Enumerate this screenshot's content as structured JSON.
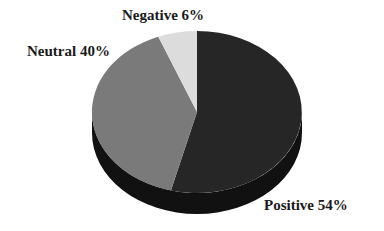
{
  "chart_data": {
    "type": "pie",
    "style": "3d",
    "title": "",
    "categories": [
      "Positive",
      "Neutral",
      "Negative"
    ],
    "values": [
      54,
      40,
      6
    ],
    "labels": [
      "Positive 54%",
      "Neutral 40%",
      "Negative 6%"
    ],
    "colors": {
      "Positive": "#262626",
      "Neutral": "#7a7a7a",
      "Negative": "#dcdcdc"
    },
    "legend": "none"
  },
  "labels": {
    "negative": "Negative 6%",
    "neutral": "Neutral 40%",
    "positive": "Positive 54%"
  }
}
